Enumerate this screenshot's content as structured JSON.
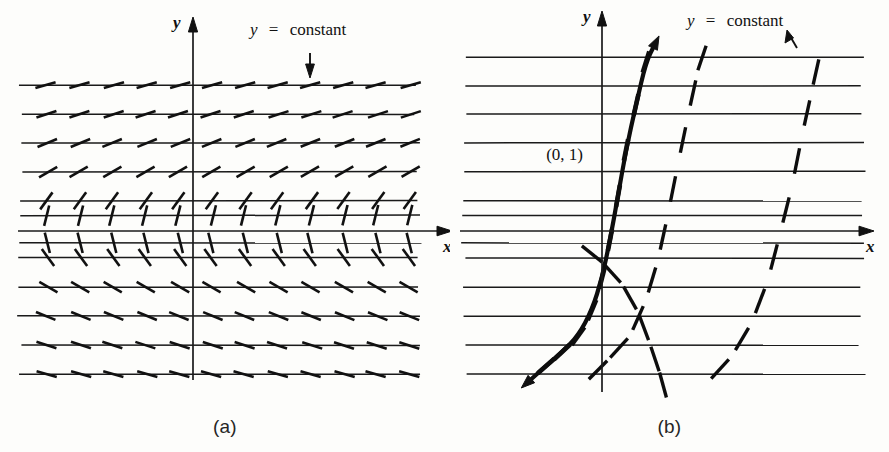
{
  "figure": {
    "title_caption_a": "(a)",
    "title_caption_b": "(b)"
  },
  "panel_a": {
    "caption": "(a)",
    "axis_x_label": "x",
    "axis_y_label": "y",
    "annotation": "y = constant",
    "annotation_parts": {
      "var": "y",
      "eq": "=",
      "value": "constant"
    },
    "pointer_direction": "down"
  },
  "panel_b": {
    "caption": "(b)",
    "axis_x_label": "x",
    "axis_y_label": "y",
    "annotation": "y = constant",
    "annotation_parts": {
      "var": "y",
      "eq": "=",
      "value": "constant"
    },
    "point_label": "(0, 1)",
    "pointer_direction": "up-left"
  },
  "colors": {
    "ink": "#1a1a1a",
    "background": "#fdfdfb",
    "caption": "#262626"
  },
  "chart_data": {
    "type": "line",
    "subtype": "direction-field",
    "xlabel": "x",
    "ylabel": "y",
    "panels": [
      {
        "name": "a",
        "caption": "(a)",
        "content": "direction field only",
        "annotation": "y = constant",
        "origin_px": [
          193,
          231
        ],
        "xlim_px": [
          18,
          452
        ],
        "ylim_px": [
          78,
          380
        ],
        "gridline_rows_px": [
          85,
          114,
          143,
          172,
          201,
          216,
          243,
          258,
          287,
          316,
          345,
          374
        ],
        "gridline_x_start_px": 20,
        "gridline_x_end_px": 418,
        "row_slopes_deg": [
          74,
          72,
          68,
          60,
          36,
          14,
          -14,
          -36,
          -60,
          -68,
          -72,
          -74
        ],
        "tick_spacing_px": 33,
        "tick_length_px": 21,
        "tick_count_per_row": 12,
        "note": "slope marks rotate from steep near top, flatten approaching the x-axis, then mirror below"
      },
      {
        "name": "b",
        "caption": "(b)",
        "content": "solution curves drawn on direction field",
        "annotation": "y = constant",
        "point_label": "(0, 1)",
        "origin_px": [
          152,
          231
        ],
        "xlim_px": [
          10,
          440
        ],
        "ylim_px": [
          40,
          385
        ],
        "gridline_rows_px": [
          57,
          86,
          114,
          143,
          172,
          201,
          216,
          228,
          243,
          258,
          287,
          316,
          345,
          374
        ],
        "gridline_x_start_px": 14,
        "gridline_x_end_px": 412,
        "curves": [
          {
            "name": "solution-through-0-1",
            "style": "solid-bold",
            "through_point": "(0, 1)",
            "points_px": [
              [
                78,
                382
              ],
              [
                96,
                366
              ],
              [
                112,
                352
              ],
              [
                128,
                336
              ],
              [
                142,
                310
              ],
              [
                152,
                278
              ],
              [
                160,
                240
              ],
              [
                168,
                196
              ],
              [
                176,
                150
              ],
              [
                186,
                105
              ],
              [
                196,
                62
              ],
              [
                205,
                44
              ]
            ]
          },
          {
            "name": "solution-curve-right-1",
            "style": "dashed",
            "points_px": [
              [
                138,
                380
              ],
              [
                158,
                360
              ],
              [
                180,
                336
              ],
              [
                196,
                300
              ],
              [
                208,
                260
              ],
              [
                218,
                214
              ],
              [
                228,
                164
              ],
              [
                238,
                116
              ],
              [
                248,
                70
              ],
              [
                256,
                46
              ]
            ]
          },
          {
            "name": "solution-curve-right-2",
            "style": "dashed",
            "points_px": [
              [
                258,
                382
              ],
              [
                282,
                356
              ],
              [
                302,
                322
              ],
              [
                318,
                280
              ],
              [
                330,
                234
              ],
              [
                342,
                186
              ],
              [
                352,
                136
              ],
              [
                362,
                90
              ],
              [
                370,
                54
              ]
            ]
          },
          {
            "name": "solution-curve-below-axis",
            "style": "dashed",
            "points_px": [
              [
                132,
                246
              ],
              [
                152,
                262
              ],
              [
                172,
                284
              ],
              [
                188,
                312
              ],
              [
                200,
                344
              ],
              [
                210,
                374
              ],
              [
                216,
                396
              ]
            ]
          }
        ],
        "note": "bold curve is the particular solution through (0, 1); dashed curves are other members of the family"
      }
    ]
  }
}
